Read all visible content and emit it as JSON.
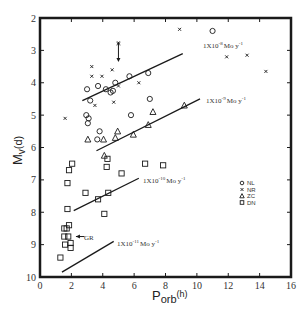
{
  "chart_data": {
    "type": "scatter",
    "title": "",
    "xlabel": "Porb (h)",
    "xlabel_main": "P",
    "xlabel_sub": "orb",
    "xlabel_unit": "(h)",
    "ylabel": "Mv(d)",
    "ylabel_main": "M",
    "ylabel_sub": "v",
    "ylabel_unit": "(d)",
    "xlim": [
      0,
      16
    ],
    "ylim": [
      10,
      2
    ],
    "y_inverted": true,
    "grid": false,
    "x_ticks": [
      0,
      2,
      4,
      6,
      8,
      10,
      12,
      14,
      16
    ],
    "y_ticks": [
      2,
      3,
      4,
      5,
      6,
      7,
      8,
      9,
      10
    ],
    "legend": {
      "position": "right-middle",
      "entries": [
        {
          "marker": "circle",
          "label": "NL"
        },
        {
          "marker": "x",
          "label": "NR"
        },
        {
          "marker": "triangle",
          "label": "ZC"
        },
        {
          "marker": "square",
          "label": "DN"
        }
      ]
    },
    "series": [
      {
        "name": "NL",
        "marker": "circle",
        "points": [
          [
            3.0,
            4.2
          ],
          [
            3.2,
            4.55
          ],
          [
            2.95,
            5.0
          ],
          [
            3.1,
            5.1
          ],
          [
            3.05,
            5.25
          ],
          [
            3.7,
            4.1
          ],
          [
            4.2,
            4.2
          ],
          [
            4.5,
            4.3
          ],
          [
            4.8,
            4.0
          ],
          [
            5.7,
            3.8
          ],
          [
            6.9,
            3.7
          ],
          [
            7.0,
            4.5
          ],
          [
            5.8,
            5.0
          ],
          [
            3.8,
            5.5
          ],
          [
            3.65,
            5.75
          ],
          [
            11.0,
            2.4
          ],
          [
            4.65,
            4.25
          ]
        ]
      },
      {
        "name": "NR",
        "marker": "x",
        "points": [
          [
            3.3,
            3.5
          ],
          [
            3.3,
            3.8
          ],
          [
            3.95,
            3.8
          ],
          [
            4.6,
            3.6
          ],
          [
            5.0,
            4.1
          ],
          [
            3.5,
            4.7
          ],
          [
            4.7,
            4.6
          ],
          [
            1.6,
            5.1
          ],
          [
            6.3,
            4.0
          ],
          [
            8.9,
            2.35
          ],
          [
            11.9,
            3.2
          ],
          [
            13.2,
            3.15
          ],
          [
            14.4,
            3.65
          ],
          [
            5.0,
            2.8
          ]
        ]
      },
      {
        "name": "ZC",
        "marker": "triangle",
        "points": [
          [
            4.05,
            5.75
          ],
          [
            4.95,
            5.5
          ],
          [
            4.8,
            5.7
          ],
          [
            5.95,
            5.6
          ],
          [
            6.9,
            5.3
          ],
          [
            7.2,
            4.9
          ],
          [
            9.2,
            4.7
          ],
          [
            4.1,
            6.25
          ],
          [
            3.05,
            5.75
          ]
        ]
      },
      {
        "name": "DN",
        "marker": "square",
        "points": [
          [
            4.3,
            6.35
          ],
          [
            4.25,
            6.6
          ],
          [
            1.85,
            6.7
          ],
          [
            2.05,
            6.5
          ],
          [
            1.75,
            7.1
          ],
          [
            6.7,
            6.5
          ],
          [
            5.2,
            6.8
          ],
          [
            7.85,
            6.55
          ],
          [
            2.9,
            7.4
          ],
          [
            4.35,
            7.4
          ],
          [
            3.7,
            7.6
          ],
          [
            1.75,
            7.9
          ],
          [
            4.1,
            8.05
          ],
          [
            1.55,
            8.5
          ],
          [
            1.7,
            8.5
          ],
          [
            1.85,
            8.4
          ],
          [
            1.55,
            8.75
          ],
          [
            1.8,
            8.75
          ],
          [
            1.6,
            9.0
          ],
          [
            1.95,
            8.95
          ],
          [
            1.95,
            9.1
          ],
          [
            1.3,
            9.4
          ]
        ]
      }
    ],
    "reference_lines": [
      {
        "label": "1X10-8 Mo y-1",
        "x": [
          2.7,
          9.1
        ],
        "y": [
          4.55,
          3.1
        ]
      },
      {
        "label": "1X10-9 Mo y-1",
        "x": [
          3.6,
          10.2
        ],
        "y": [
          6.1,
          4.5
        ]
      },
      {
        "label": "1X10-10 Mo y-1",
        "x": [
          2.15,
          6.3
        ],
        "y": [
          7.95,
          6.95
        ]
      },
      {
        "label": "1X10-11 Mo y-1",
        "x": [
          1.4,
          4.7
        ],
        "y": [
          9.85,
          8.9
        ]
      }
    ],
    "annotations": [
      {
        "text": "GR",
        "x": 2.9,
        "y": 8.75,
        "arrow_to": [
          2.1,
          8.75
        ]
      },
      {
        "text": "arrow",
        "x": 5.0,
        "y": 3.2,
        "note": "downward arrow at Porb~5h, Mv~2.8-3.2"
      }
    ]
  },
  "labels": {
    "line_8": "1X10",
    "line_8_exp": "-8",
    "line_8_unit": "Mo y",
    "line_8_unit_exp": "-1",
    "line_9": "1X10",
    "line_9_exp": "-9",
    "line_9_unit": "Mo y",
    "line_9_unit_exp": "-1",
    "line_10": "1X10",
    "line_10_exp": "-10",
    "line_10_unit": "Mo y",
    "line_10_unit_exp": "-1",
    "line_11": "1X10",
    "line_11_exp": "-11",
    "line_11_unit": "Mo y",
    "line_11_unit_exp": "-1",
    "gr": "GR"
  }
}
